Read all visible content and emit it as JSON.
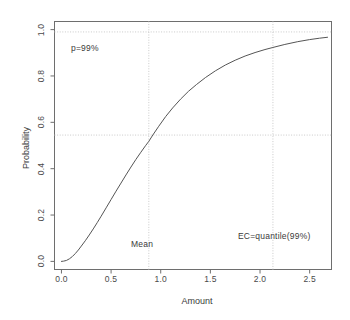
{
  "chart_data": {
    "type": "line",
    "title": "",
    "xlabel": "Amount",
    "ylabel": "Probability",
    "xlim": [
      -0.07,
      2.72
    ],
    "ylim": [
      -0.035,
      1.035
    ],
    "xticks": [
      "0.0",
      "0.5",
      "1.0",
      "1.5",
      "2.0",
      "2.5"
    ],
    "xtick_values": [
      0.0,
      0.5,
      1.0,
      1.5,
      2.0,
      2.5
    ],
    "yticks": [
      "0.0",
      "0.2",
      "0.4",
      "0.6",
      "0.8",
      "1.0"
    ],
    "ytick_values": [
      0.0,
      0.2,
      0.4,
      0.6,
      0.8,
      1.0
    ],
    "grid": false,
    "legend": "none",
    "series": [
      {
        "name": "Cumulative distribution",
        "color": "#555555",
        "x": [
          0.0,
          0.02,
          0.05,
          0.08,
          0.11,
          0.14,
          0.17,
          0.2,
          0.24,
          0.28,
          0.32,
          0.36,
          0.4,
          0.45,
          0.5,
          0.55,
          0.6,
          0.65,
          0.7,
          0.75,
          0.8,
          0.85,
          0.88,
          0.92,
          0.98,
          1.05,
          1.12,
          1.2,
          1.28,
          1.36,
          1.45,
          1.55,
          1.65,
          1.75,
          1.85,
          1.95,
          2.05,
          2.13,
          2.25,
          2.38,
          2.5,
          2.6,
          2.68
        ],
        "y": [
          0.0,
          0.001,
          0.004,
          0.011,
          0.021,
          0.034,
          0.049,
          0.066,
          0.089,
          0.114,
          0.14,
          0.167,
          0.195,
          0.231,
          0.267,
          0.303,
          0.338,
          0.373,
          0.407,
          0.44,
          0.471,
          0.501,
          0.518,
          0.545,
          0.583,
          0.625,
          0.662,
          0.7,
          0.734,
          0.763,
          0.793,
          0.822,
          0.847,
          0.868,
          0.886,
          0.901,
          0.914,
          0.923,
          0.936,
          0.948,
          0.957,
          0.963,
          0.967
        ]
      }
    ],
    "reference_lines": [
      {
        "name": "p-level-horizontal",
        "orientation": "horizontal",
        "value": 0.99,
        "label": "p=99%",
        "style": "dotted",
        "color": "#c8c8c8"
      },
      {
        "name": "mean-vertical",
        "orientation": "vertical",
        "value": 0.88,
        "label": "Mean",
        "style": "dotted",
        "color": "#c8c8c8"
      },
      {
        "name": "mean-probability-horizontal",
        "orientation": "horizontal",
        "value": 0.545,
        "label": "",
        "style": "dotted",
        "color": "#c8c8c8"
      },
      {
        "name": "ec-quantile-vertical",
        "orientation": "vertical",
        "value": 2.13,
        "label": "EC=quantile(99%)",
        "style": "dotted",
        "color": "#c8c8c8"
      }
    ],
    "annotations": [
      {
        "name": "p-level-annotation",
        "text": "p=99%",
        "x": 0.17,
        "y": 0.925
      },
      {
        "name": "mean-annotation",
        "text": "Mean",
        "x": 0.78,
        "y": 0.115
      },
      {
        "name": "ec-annotation",
        "text": "EC=quantile(99%)",
        "x": 1.86,
        "y": 0.155
      }
    ]
  },
  "axes": {
    "x_title": "Amount",
    "y_title": "Probability",
    "x_tick_labels": [
      "0.0",
      "0.5",
      "1.0",
      "1.5",
      "2.0",
      "2.5"
    ],
    "y_tick_labels": [
      "0.0",
      "0.2",
      "0.4",
      "0.6",
      "0.8",
      "1.0"
    ]
  },
  "colors": {
    "curve": "#555555",
    "axis": "#6e6e6e",
    "reference": "#c9c9c9",
    "text": "#3a3a3a",
    "background": "#ffffff"
  }
}
